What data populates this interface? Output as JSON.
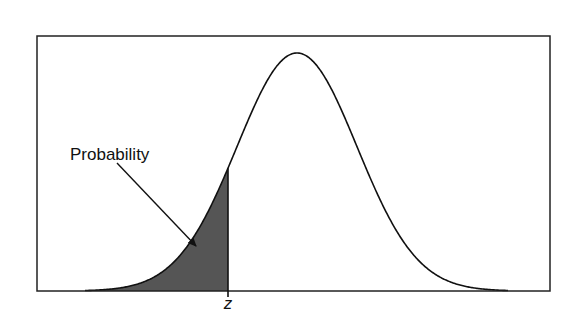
{
  "diagram": {
    "annotation_label": "Probability",
    "z_label": "z",
    "colors": {
      "frame": "#222222",
      "curve": "#111111",
      "shaded_area": "#555555",
      "background": "#ffffff"
    },
    "frame": {
      "x1": 37,
      "y1": 36,
      "x2": 550,
      "y2": 291
    },
    "curve": {
      "mean_x": 297,
      "sigma_px": 60,
      "peak_y": 53,
      "baseline_y": 291,
      "left_x": 85,
      "right_x": 508
    },
    "z_x": 228,
    "arrow": {
      "x1": 117,
      "y1": 163,
      "x2": 196,
      "y2": 246
    }
  },
  "chart_data": {
    "type": "area",
    "title": "",
    "xlabel": "",
    "ylabel": "",
    "tick_labels": [
      "z"
    ],
    "annotations": [
      "Probability"
    ],
    "shaded_region": "left tail up to z (approximately -1.15 standard deviations)",
    "grid": false,
    "legend": "none"
  }
}
